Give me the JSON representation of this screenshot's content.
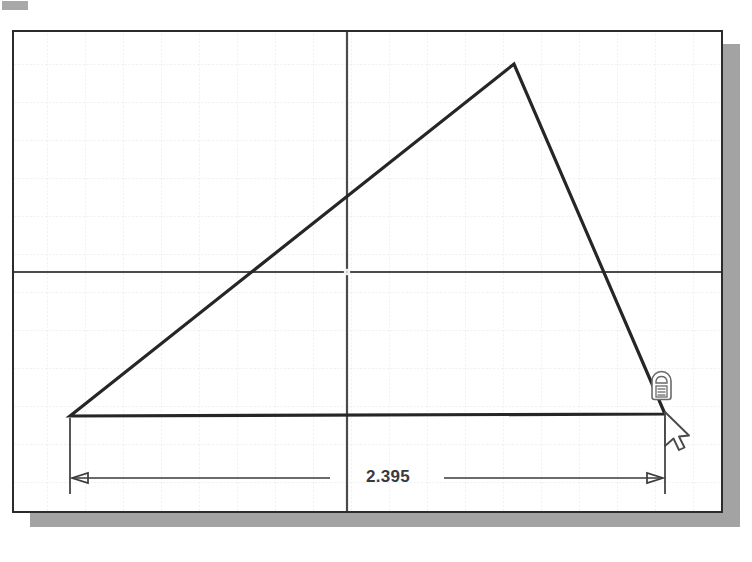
{
  "app": {
    "type": "cad-sketch-viewport",
    "title": "Sketch Viewport",
    "background_color": "#ffffff",
    "canvas_border_color": "#2b2b2b",
    "shadow_color": "#a3a3a3"
  },
  "corner_tab": {
    "name": "corner-tab",
    "color": "#a8a8a8"
  },
  "grid": {
    "minor_spacing_px": 38,
    "minor_color": "#e2e2e2",
    "axis_color": "#4a4a4a",
    "origin_x": 333,
    "origin_y": 240,
    "visible": true
  },
  "geometry": {
    "line_color": "#262626",
    "line_width": 3,
    "shape": "triangle",
    "vertices": [
      {
        "name": "bottom-left-vertex",
        "x": 56,
        "y": 384
      },
      {
        "name": "apex-vertex",
        "x": 500,
        "y": 32
      },
      {
        "name": "bottom-right-vertex",
        "x": 651,
        "y": 382
      }
    ]
  },
  "dimension": {
    "name": "horizontal-linear-dimension",
    "value": "2.395",
    "color": "#3a3a3a",
    "text_x": 390,
    "text_y": 468,
    "dim_line_y": 446,
    "left_extension_x": 56,
    "right_extension_x": 651,
    "extension_top_y": 384,
    "extension_bottom_y": 462,
    "arrow_style": "open-arrow-outward"
  },
  "cursor": {
    "name": "dimension-tool-cursor",
    "icon": "dimension-badge-icon",
    "pointer_x": 651,
    "pointer_y": 382,
    "arrow_x": 660,
    "arrow_y": 388,
    "badge_x": 648,
    "badge_y": 348,
    "color": "#555555"
  }
}
